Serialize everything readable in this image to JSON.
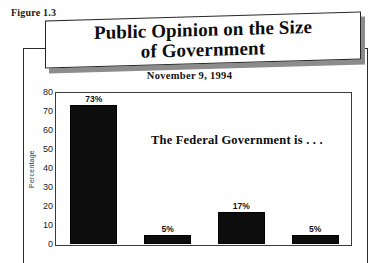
{
  "figure": {
    "label": "Figure 1.3"
  },
  "title": {
    "line1": "Public Opinion on the Size",
    "line2": "of Government"
  },
  "subtitle": "November 9, 1994",
  "annotation": "The Federal Government is . . .",
  "axis": {
    "y_title": "Percentage",
    "ticks": [
      "80",
      "70",
      "60",
      "50",
      "40",
      "30",
      "20",
      "10",
      "0"
    ]
  },
  "bars": [
    {
      "value_label": "73%"
    },
    {
      "value_label": "5%"
    },
    {
      "value_label": "17%"
    },
    {
      "value_label": "5%"
    }
  ],
  "chart_data": {
    "type": "bar",
    "title": "Public Opinion on the Size of Government",
    "subtitle": "November 9, 1994",
    "annotation": "The Federal Government is . . .",
    "categories": [
      "",
      "",
      "",
      ""
    ],
    "values": [
      73,
      5,
      17,
      5
    ],
    "data_labels": [
      "73%",
      "5%",
      "17%",
      "5%"
    ],
    "xlabel": "",
    "ylabel": "Percentage",
    "ylim": [
      0,
      80
    ],
    "yticks": [
      0,
      10,
      20,
      30,
      40,
      50,
      60,
      70,
      80
    ],
    "grid": false,
    "legend": false,
    "bar_color": "#0d0d0d",
    "background_color": "#ffffff",
    "note": "Category axis labels are cropped off the bottom of the screenshot."
  }
}
